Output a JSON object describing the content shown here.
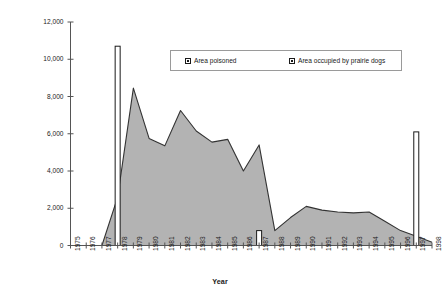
{
  "chart_data": {
    "type": "area",
    "title": "",
    "xlabel": "Year",
    "ylabel": "Area occupied by prairie dogs (hectares)",
    "xlim": [
      1975,
      1998
    ],
    "ylim": [
      0,
      12000
    ],
    "grid": false,
    "legend_position": "top-center",
    "y_ticks": [
      0,
      2000,
      4000,
      6000,
      8000,
      10000,
      12000
    ],
    "y_tick_labels": [
      "0",
      "2,000",
      "4,000",
      "6,000",
      "8,000",
      "10,000",
      "12,000"
    ],
    "categories": [
      1975,
      1976,
      1977,
      1978,
      1979,
      1980,
      1981,
      1982,
      1983,
      1984,
      1985,
      1986,
      1987,
      1988,
      1989,
      1990,
      1991,
      1992,
      1993,
      1994,
      1995,
      1996,
      1997,
      1998
    ],
    "x_tick_labels": [
      "1975",
      "1976",
      "1977",
      "1978",
      "1979",
      "1980",
      "1981",
      "1982",
      "1983",
      "1984",
      "1985",
      "1986",
      "1987",
      "1988",
      "1989",
      "1990",
      "1991",
      "1992",
      "1993",
      "1994",
      "1995",
      "1996",
      "1997",
      "1998"
    ],
    "series": [
      {
        "name": "Area occupied by prairie dogs",
        "type": "area",
        "fill_color": "#b3b3b3",
        "line_color": "#333333",
        "values": [
          0,
          0,
          0,
          2600,
          8450,
          5750,
          5350,
          7250,
          6150,
          5550,
          5700,
          4000,
          5400,
          800,
          1500,
          2100,
          1900,
          1800,
          1750,
          1800,
          1300,
          800,
          500,
          180
        ]
      },
      {
        "name": "Area poisoned",
        "type": "bar",
        "fill_color": "#ffffff",
        "line_color": "#1a1a1a",
        "values": [
          0,
          0,
          0,
          10700,
          0,
          0,
          0,
          0,
          0,
          0,
          0,
          0,
          800,
          0,
          0,
          0,
          0,
          0,
          0,
          0,
          0,
          0,
          6100,
          0
        ]
      }
    ],
    "legend": [
      {
        "label": "Area poisoned",
        "swatch": "poisoned"
      },
      {
        "label": "Area occupied by prairie dogs",
        "swatch": "occupied"
      }
    ]
  }
}
